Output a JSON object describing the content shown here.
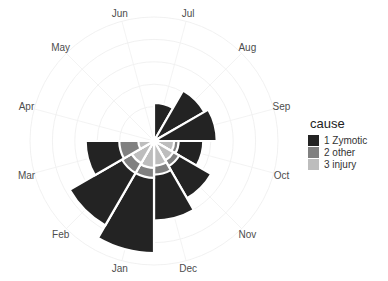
{
  "chart_data": {
    "type": "bar",
    "subtype": "polar-stacked (Nightingale rose / coxcomb)",
    "title": "",
    "xlabel": "",
    "ylabel": "",
    "grid": true,
    "legend_position": "right",
    "legend_title": "cause",
    "categories": [
      "Jul",
      "Aug",
      "Sep",
      "Oct",
      "Nov",
      "Dec",
      "Jan",
      "Feb",
      "Mar",
      "Apr",
      "May",
      "Jun"
    ],
    "radius_scale_note": "outer radii in relative units (100 = outer grid ring)",
    "series": [
      {
        "name": "1 Zymotic",
        "color": "#232323",
        "outer": [
          34,
          52,
          56,
          44,
          59,
          71,
          100,
          87,
          61,
          2,
          2,
          3
        ]
      },
      {
        "name": "2 other",
        "color": "#808080",
        "outer": [
          2,
          3,
          4,
          22,
          26,
          30,
          33,
          33,
          31,
          1,
          1,
          2
        ]
      },
      {
        "name": "3 injury",
        "color": "#bdbdbd",
        "outer": [
          1,
          2,
          3,
          18,
          20,
          22,
          24,
          23,
          14,
          1,
          1,
          1
        ]
      }
    ],
    "grid_rings": [
      20,
      40,
      60,
      80,
      100
    ]
  },
  "legend": {
    "title": "cause",
    "items": [
      {
        "label": "1 Zymotic",
        "color": "#232323"
      },
      {
        "label": "2 other",
        "color": "#808080"
      },
      {
        "label": "3 injury",
        "color": "#bdbdbd"
      }
    ]
  }
}
